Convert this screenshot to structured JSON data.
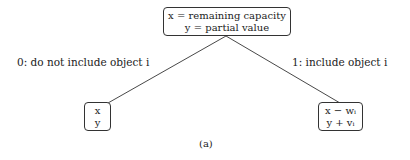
{
  "diagram": {
    "root": {
      "line1": "x = remaining capacity",
      "line2": "y = partial value"
    },
    "left_edge_label": "0: do not include object i",
    "right_edge_label": "1: include object i",
    "left_child": {
      "line1": "x",
      "line2": "y"
    },
    "right_child": {
      "line1": "x − wᵢ",
      "line2": "y + vᵢ"
    },
    "caption": "(a)"
  }
}
